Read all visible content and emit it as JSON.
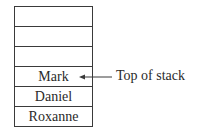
{
  "stack": {
    "cells": [
      {
        "label": ""
      },
      {
        "label": ""
      },
      {
        "label": ""
      },
      {
        "label": "Mark"
      },
      {
        "label": "Daniel"
      },
      {
        "label": "Roxanne"
      }
    ]
  },
  "annotation": {
    "label": "Top of stack",
    "points_to": "Mark",
    "icon": "arrow-left-icon"
  }
}
